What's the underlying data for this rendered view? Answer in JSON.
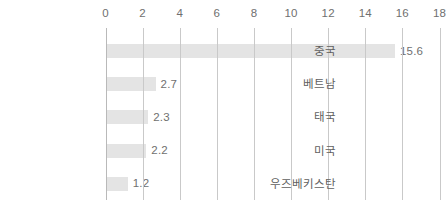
{
  "chart_data": {
    "type": "bar",
    "orientation": "horizontal",
    "title": "",
    "subtitle": "",
    "xlabel": "",
    "ylabel": "",
    "categories": [
      "중국",
      "베트남",
      "태국",
      "미국",
      "우즈베키스탄"
    ],
    "values": [
      15.6,
      2.7,
      2.3,
      2.2,
      1.2
    ],
    "value_labels": [
      "15.6",
      "2.7",
      "2.3",
      "2.2",
      "1.2"
    ],
    "xlim": [
      0,
      18
    ],
    "xticks": [
      0,
      2,
      4,
      6,
      8,
      10,
      12,
      14,
      16,
      18
    ],
    "xtick_labels": [
      "0",
      "2",
      "4",
      "6",
      "8",
      "10",
      "12",
      "14",
      "16",
      "18"
    ],
    "grid": true,
    "grid_axis": "x",
    "legend": false,
    "legend_position": "none",
    "series": [
      {
        "name": "",
        "values": [
          15.6,
          2.7,
          2.3,
          2.2,
          1.2
        ]
      }
    ],
    "colors": {
      "bar_fill": "#e4e4e4",
      "gridline": "#c9c9c9",
      "axis_line": "#b9b9b9",
      "tick_text": "#6f6f6f",
      "value_text": "#6f6f6f",
      "category_text": "#5f5f5f",
      "background": "#ffffff"
    }
  }
}
